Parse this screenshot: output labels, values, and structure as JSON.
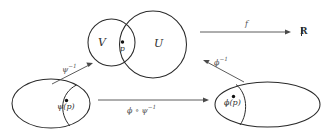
{
  "figure": {
    "type": "commutative-diagram",
    "background_color": "#ffffff",
    "stroke_color": "#2a2a2a",
    "label_color": "#2f2f2f"
  },
  "sets": {
    "chart_domain_v": "V",
    "chart_domain_u": "U",
    "codomain": "R"
  },
  "points": {
    "manifold_point": "p",
    "psi_image_point": "ψ(p)",
    "phi_image_point": "ϕ(p)"
  },
  "maps": {
    "f": "f",
    "psi_inverse_base": "ψ",
    "psi_inverse_exp": "−1",
    "phi_inverse_base": "ϕ",
    "phi_inverse_exp": "−1",
    "transition_base": "ϕ ∘ ψ",
    "transition_exp": "−1"
  },
  "geometry": {
    "circle_v": {
      "cx": 111.5,
      "cy": 42.5,
      "r": 23.5
    },
    "circle_u": {
      "cx": 153.0,
      "cy": 44.5,
      "r": 33.5
    },
    "ellipse_left": {
      "cx": 51.0,
      "cy": 103.5,
      "rx": 39.0,
      "ry": 24.5
    },
    "ellipse_right": {
      "cx": 267.5,
      "cy": 104.5,
      "rx": 52.5,
      "ry": 22.5
    },
    "arrow_f": {
      "x1": 200,
      "y1": 32,
      "x2": 291,
      "y2": 32
    },
    "arrow_transition": {
      "x1": 98,
      "y1": 100,
      "x2": 209,
      "y2": 100
    },
    "arrow_psi_inv": {
      "x1": 52,
      "y1": 84,
      "x2": 93,
      "y2": 63
    },
    "arrow_phi_inv": {
      "x1": 244,
      "y1": 82,
      "x2": 203,
      "y2": 60
    }
  }
}
